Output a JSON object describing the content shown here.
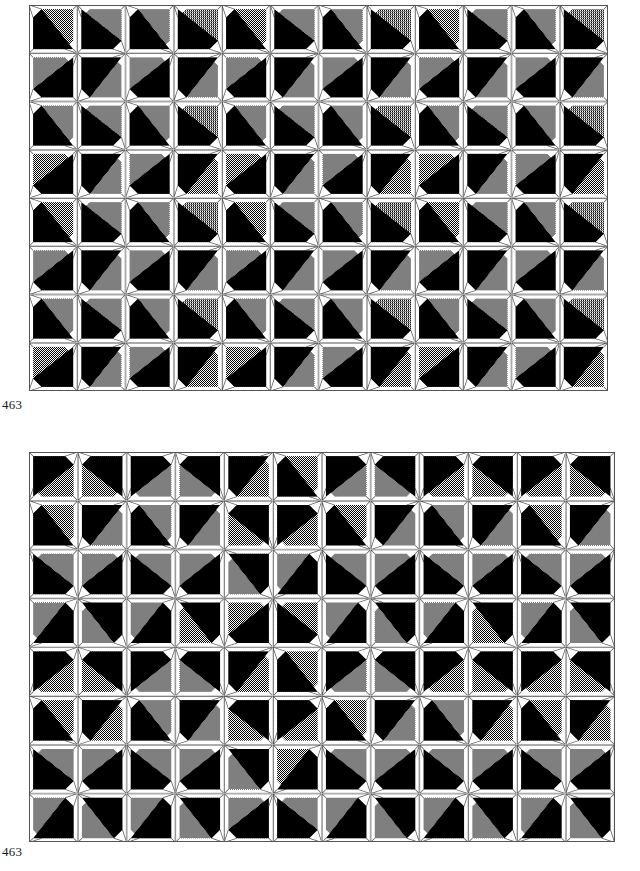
{
  "page": {
    "background_color": "#ffffff",
    "width": 640,
    "height": 871,
    "kind": "two tiled geometric quilt-block pattern plates"
  },
  "colors": {
    "black": "#000000",
    "gray_dither": "#808080",
    "white": "#ffffff",
    "outline": "#555555",
    "caption_text": "#1a1a1a"
  },
  "figures": [
    {
      "id": "plate-top",
      "caption": "463",
      "x": 29,
      "y": 5,
      "width": 579,
      "height": 386,
      "cell": 48.25,
      "cols": 12,
      "rows": 8,
      "description": "Repeating pinwheel / arrow band pattern: every tile is a square framed by white corner wedges with a black-and-gray diagonally split octagon inside; tiles alternate rotation in a two-by-two repeat producing vertical arrow columns.",
      "rotation_grid": [
        [
          0,
          1,
          0,
          1,
          0,
          1,
          0,
          1,
          0,
          1,
          0,
          1
        ],
        [
          3,
          2,
          3,
          2,
          3,
          2,
          3,
          2,
          3,
          2,
          3,
          2
        ],
        [
          0,
          1,
          0,
          1,
          0,
          1,
          0,
          1,
          0,
          1,
          0,
          1
        ],
        [
          3,
          2,
          3,
          2,
          3,
          2,
          3,
          2,
          3,
          2,
          3,
          2
        ],
        [
          0,
          1,
          0,
          1,
          0,
          1,
          0,
          1,
          0,
          1,
          0,
          1
        ],
        [
          3,
          2,
          3,
          2,
          3,
          2,
          3,
          2,
          3,
          2,
          3,
          2
        ],
        [
          0,
          1,
          0,
          1,
          0,
          1,
          0,
          1,
          0,
          1,
          0,
          1
        ],
        [
          3,
          2,
          3,
          2,
          3,
          2,
          3,
          2,
          3,
          2,
          3,
          2
        ]
      ],
      "mirror_grid": [
        [
          0,
          1,
          0,
          1,
          0,
          1,
          0,
          1,
          0,
          1,
          0,
          1
        ],
        [
          0,
          1,
          0,
          1,
          0,
          1,
          0,
          1,
          0,
          1,
          0,
          1
        ],
        [
          0,
          1,
          0,
          1,
          0,
          1,
          0,
          1,
          0,
          1,
          0,
          1
        ],
        [
          0,
          1,
          0,
          1,
          0,
          1,
          0,
          1,
          0,
          1,
          0,
          1
        ],
        [
          0,
          1,
          0,
          1,
          0,
          1,
          0,
          1,
          0,
          1,
          0,
          1
        ],
        [
          0,
          1,
          0,
          1,
          0,
          1,
          0,
          1,
          0,
          1,
          0,
          1
        ],
        [
          0,
          1,
          0,
          1,
          0,
          1,
          0,
          1,
          0,
          1,
          0,
          1
        ],
        [
          0,
          1,
          0,
          1,
          0,
          1,
          0,
          1,
          0,
          1,
          0,
          1
        ]
      ]
    },
    {
      "id": "plate-bottom",
      "caption": "463",
      "x": 29,
      "y": 452,
      "width": 586,
      "height": 409,
      "cell": 48.8,
      "cols": 12,
      "rows": 8,
      "description": "Second plate, same tile vocabulary rearranged: paired tiles meet point-to-point forming hourglass and bowtie motifs, with clusters of four-tile stars scattered across the field.",
      "rotation_grid": [
        [
          1,
          3,
          1,
          3,
          2,
          0,
          1,
          3,
          1,
          3,
          1,
          3
        ],
        [
          0,
          2,
          0,
          2,
          3,
          1,
          0,
          2,
          0,
          2,
          0,
          2
        ],
        [
          1,
          3,
          1,
          3,
          2,
          0,
          1,
          3,
          1,
          3,
          1,
          3
        ],
        [
          0,
          2,
          0,
          2,
          3,
          1,
          0,
          2,
          0,
          2,
          0,
          2
        ],
        [
          1,
          3,
          1,
          3,
          2,
          0,
          1,
          3,
          1,
          3,
          1,
          3
        ],
        [
          0,
          2,
          0,
          2,
          3,
          1,
          0,
          2,
          0,
          2,
          0,
          2
        ],
        [
          1,
          3,
          1,
          3,
          2,
          0,
          1,
          3,
          1,
          3,
          1,
          3
        ],
        [
          0,
          2,
          0,
          2,
          3,
          1,
          0,
          2,
          0,
          2,
          0,
          2
        ]
      ],
      "mirror_grid": [
        [
          0,
          1,
          0,
          1,
          1,
          0,
          0,
          1,
          0,
          1,
          0,
          1
        ],
        [
          0,
          1,
          0,
          1,
          1,
          0,
          0,
          1,
          0,
          1,
          0,
          1
        ],
        [
          1,
          0,
          1,
          0,
          0,
          1,
          1,
          0,
          1,
          0,
          1,
          0
        ],
        [
          1,
          0,
          1,
          0,
          0,
          1,
          1,
          0,
          1,
          0,
          1,
          0
        ],
        [
          0,
          1,
          0,
          1,
          1,
          0,
          0,
          1,
          0,
          1,
          0,
          1
        ],
        [
          0,
          1,
          0,
          1,
          1,
          0,
          0,
          1,
          0,
          1,
          0,
          1
        ],
        [
          1,
          0,
          1,
          0,
          0,
          1,
          1,
          0,
          1,
          0,
          1,
          0
        ],
        [
          1,
          0,
          1,
          0,
          0,
          1,
          1,
          0,
          1,
          0,
          1,
          0
        ]
      ]
    }
  ],
  "captions": {
    "top": "463",
    "bottom": "463"
  }
}
